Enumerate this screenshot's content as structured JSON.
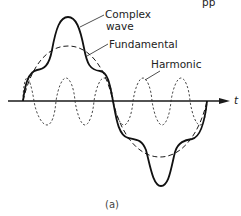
{
  "figure": {
    "caption": "(a)",
    "axis_label": "t",
    "partial_header_text": "pp",
    "labels": {
      "complex_line1": "Complex",
      "complex_line2": "wave",
      "fundamental": "Fundamental",
      "harmonic": "Harmonic"
    },
    "colors": {
      "ink": "#1a1a1a",
      "background": "#ffffff"
    },
    "waves": [
      {
        "name": "Complex wave",
        "style": "solid-thick"
      },
      {
        "name": "Fundamental",
        "style": "dashed"
      },
      {
        "name": "Harmonic",
        "style": "dotted-dashed",
        "frequency_multiple": 5
      }
    ]
  }
}
